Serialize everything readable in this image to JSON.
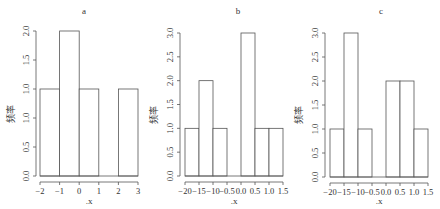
{
  "chart_data": [
    {
      "type": "bar",
      "title": "a",
      "xlabel": ".x",
      "ylabel": "频率",
      "bins": [
        -2,
        -1,
        0,
        1,
        2,
        3
      ],
      "x_tick_labels": [
        "-2",
        "-1",
        "0",
        "1",
        "2",
        "3"
      ],
      "values": [
        1,
        2,
        1,
        0,
        1
      ],
      "y_tick_labels": [
        "0.0",
        "0.5",
        "1.0",
        "1.0",
        "1.5",
        "2.0"
      ],
      "y_tick_values": [
        0,
        0.4,
        0.8,
        1.2,
        1.6,
        2.0
      ],
      "value_positions": [
        1.2,
        2.0,
        1.2,
        0,
        1.2
      ],
      "ylim": [
        0,
        2.0
      ],
      "grid": false
    },
    {
      "type": "bar",
      "title": "b",
      "xlabel": ".x",
      "ylabel": "频率",
      "bins": [
        -2.0,
        -1.5,
        -1.0,
        -0.5,
        0.0,
        0.5,
        1.0,
        1.5
      ],
      "x_tick_labels": [
        "-20",
        "-15",
        "-10",
        "-0.5",
        "0.0",
        "0.5",
        "1.0",
        "1.5"
      ],
      "values": [
        1,
        2,
        1,
        0,
        3,
        1,
        1
      ],
      "y_tick_labels": [
        "0.0",
        "0.5",
        "1.0",
        "1.5",
        "2.0",
        "2.5",
        "3.0"
      ],
      "y_tick_values": [
        0,
        0.5,
        1.0,
        1.5,
        2.0,
        2.5,
        3.0
      ],
      "value_positions": [
        1,
        2,
        1,
        0,
        3,
        1,
        1
      ],
      "ylim": [
        0,
        3.0
      ],
      "grid": false
    },
    {
      "type": "bar",
      "title": "c",
      "xlabel": ".x",
      "ylabel": "频率",
      "bins": [
        -2.0,
        -1.5,
        -1.0,
        -0.5,
        0.0,
        0.5,
        1.0,
        1.5
      ],
      "x_tick_labels": [
        "-20",
        "-15",
        "-10",
        "-0.5",
        "0.0",
        "0.5",
        "1.0",
        "1.5"
      ],
      "values": [
        1,
        3,
        1,
        0,
        2,
        2,
        1
      ],
      "y_tick_labels": [
        "0.0",
        "0.5",
        "1.0",
        "1.5",
        "2.0",
        "2.5",
        "3.0"
      ],
      "y_tick_values": [
        0,
        0.5,
        1.0,
        1.5,
        2.0,
        2.5,
        3.0
      ],
      "value_positions": [
        1,
        3,
        1,
        0,
        2,
        2,
        1
      ],
      "ylim": [
        0,
        3.0
      ],
      "grid": false
    }
  ]
}
